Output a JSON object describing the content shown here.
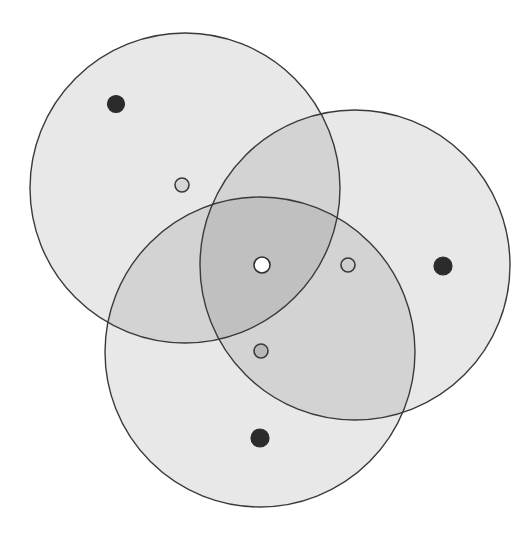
{
  "figure": {
    "width": 526,
    "height": 534,
    "background_color": "#ffffff"
  },
  "chart_data": {
    "type": "venn",
    "xlabel": "",
    "ylabel": "",
    "grid": false,
    "legend": "none",
    "xlim": [
      0,
      526
    ],
    "ylim": [
      0,
      534
    ],
    "coordinate_note": "Pixel coordinates, origin at top-left of the 526x534 image",
    "sets": [
      {
        "id": "set-a",
        "name": "Top-left circle",
        "cx": 185,
        "cy": 188,
        "r": 155,
        "fill": "#e3e3e3",
        "fill_opacity": 0.82,
        "stroke": "#3a3a3a",
        "stroke_width": 1.4
      },
      {
        "id": "set-b",
        "name": "Right circle",
        "cx": 355,
        "cy": 265,
        "r": 155,
        "fill": "#e3e3e3",
        "fill_opacity": 0.82,
        "stroke": "#3a3a3a",
        "stroke_width": 1.4
      },
      {
        "id": "set-c",
        "name": "Bottom circle",
        "cx": 260,
        "cy": 352,
        "r": 155,
        "fill": "#e3e3e3",
        "fill_opacity": 0.82,
        "stroke": "#3a3a3a",
        "stroke_width": 1.4
      }
    ],
    "points": [
      {
        "id": "point-a-only",
        "name": "dark-dot-top-left",
        "region": "set-a only",
        "x": 116,
        "y": 104,
        "r": 8.5,
        "fill": "#2b2b2b",
        "stroke": "#2b2b2b",
        "stroke_width": 1.2,
        "style": "filled-dark"
      },
      {
        "id": "point-a-light",
        "name": "light-ring-upper-left",
        "region": "set-a only",
        "x": 182,
        "y": 185,
        "r": 7,
        "fill": "#d6d6d6",
        "stroke": "#3a3a3a",
        "stroke_width": 1.6,
        "style": "outlined-light"
      },
      {
        "id": "point-b-only",
        "name": "dark-dot-right",
        "region": "set-b only",
        "x": 443,
        "y": 266,
        "r": 9,
        "fill": "#2b2b2b",
        "stroke": "#2b2b2b",
        "stroke_width": 1.2,
        "style": "filled-dark"
      },
      {
        "id": "point-b-light",
        "name": "light-ring-right-of-center",
        "region": "set-a and set-b",
        "x": 348,
        "y": 265,
        "r": 7,
        "fill": "#cfcfcf",
        "stroke": "#3a3a3a",
        "stroke_width": 1.6,
        "style": "outlined-light"
      },
      {
        "id": "point-c-only",
        "name": "dark-dot-bottom",
        "region": "set-c only",
        "x": 260,
        "y": 438,
        "r": 9,
        "fill": "#2b2b2b",
        "stroke": "#2b2b2b",
        "stroke_width": 1.2,
        "style": "filled-dark"
      },
      {
        "id": "point-c-light",
        "name": "gray-ring-below-center",
        "region": "set-b and set-c",
        "x": 261,
        "y": 351,
        "r": 7,
        "fill": "#b8b8b8",
        "stroke": "#3a3a3a",
        "stroke_width": 1.6,
        "style": "outlined-gray"
      },
      {
        "id": "point-center",
        "name": "white-dot-center",
        "region": "set-a and set-b and set-c",
        "x": 262,
        "y": 265,
        "r": 8,
        "fill": "#ffffff",
        "stroke": "#2f2f2f",
        "stroke_width": 1.6,
        "style": "filled-white"
      }
    ]
  }
}
